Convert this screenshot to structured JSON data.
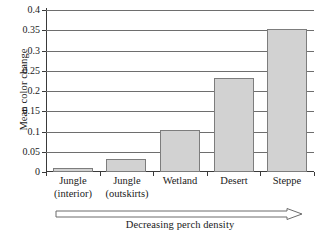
{
  "chart_data": {
    "type": "bar",
    "title": "",
    "xlabel": "Decreasing perch density",
    "ylabel": "Mean color change",
    "categories": [
      "Jungle (interior)",
      "Jungle (outskirts)",
      "Wetland",
      "Desert",
      "Steppe"
    ],
    "category_lines": [
      [
        "Jungle",
        "(interior)"
      ],
      [
        "Jungle",
        "(outskirts)"
      ],
      [
        "Wetland",
        ""
      ],
      [
        "Desert",
        ""
      ],
      [
        "Steppe",
        ""
      ]
    ],
    "values": [
      0.009,
      0.032,
      0.103,
      0.232,
      0.352
    ],
    "ylim": [
      0,
      0.4
    ],
    "ytick_labels": [
      "0",
      "0.05",
      "0.1",
      "0.15",
      "0.2",
      "0.25",
      "0.3",
      "0.35",
      "0.4"
    ],
    "ytick_values": [
      0,
      0.05,
      0.1,
      0.15,
      0.2,
      0.25,
      0.3,
      0.35,
      0.4
    ],
    "grid": true,
    "legend": false,
    "bar_fill_color": "#d2d2d2",
    "bar_border_color": "#7d7d7d",
    "axis_color": "#3a3a3a",
    "gridline_color": "#6e6e6e"
  },
  "annotation": {
    "arrow_direction": "right",
    "arrow_caption": "Decreasing perch density"
  }
}
